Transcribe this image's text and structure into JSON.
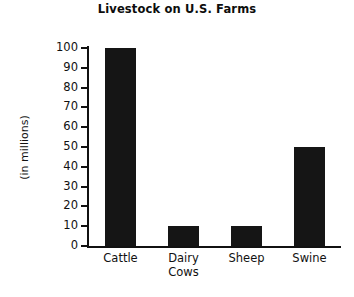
{
  "chart_data": {
    "type": "bar",
    "title": "Livestock on U.S. Farms",
    "xlabel": "",
    "ylabel": "(in millions)",
    "categories": [
      "Cattle",
      "Dairy Cows",
      "Sheep",
      "Swine"
    ],
    "category_lines": [
      [
        "Cattle"
      ],
      [
        "Dairy",
        "Cows"
      ],
      [
        "Sheep"
      ],
      [
        "Swine"
      ]
    ],
    "values": [
      100,
      10,
      10,
      50
    ],
    "ylim": [
      0,
      100
    ],
    "ytick_step": 10,
    "yticks": [
      100,
      90,
      80,
      70,
      60,
      50,
      40,
      30,
      20,
      10,
      0
    ],
    "ytick_labels": [
      "100",
      "90",
      "80",
      "70",
      "60",
      "50",
      "40",
      "30",
      "20",
      "10",
      "0"
    ],
    "grid": false,
    "legend": false,
    "bar_color": "#151515",
    "axis_color": "#111111",
    "background_color": "#ffffff"
  }
}
